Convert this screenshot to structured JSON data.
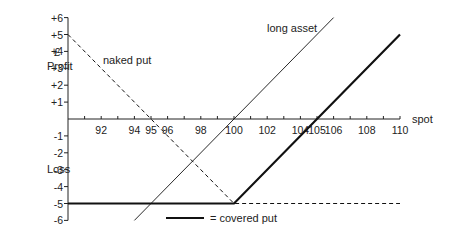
{
  "chart_data": {
    "type": "line",
    "title": "",
    "xlabel": "spot",
    "ylabel_top": "£\nProfit",
    "ylabel_bottom": "Loss",
    "xlim": [
      90,
      110
    ],
    "ylim": [
      -6,
      6
    ],
    "x_ticks": [
      92,
      94,
      95,
      96,
      98,
      100,
      102,
      104,
      105,
      106,
      108,
      110
    ],
    "y_ticks": [
      "+6",
      "+5",
      "+4",
      "+3",
      "+2",
      "+1",
      "-1",
      "-2",
      "-3",
      "-4",
      "-5",
      "-6"
    ],
    "grid": false,
    "series": [
      {
        "name": "naked put",
        "style": "dashed",
        "x": [
          90,
          100,
          110
        ],
        "y": [
          5,
          -5,
          -5
        ]
      },
      {
        "name": "long asset",
        "style": "thin-solid",
        "x": [
          94,
          106
        ],
        "y": [
          -6,
          6
        ]
      },
      {
        "name": "covered put",
        "style": "thick-solid",
        "x": [
          90,
          100,
          110
        ],
        "y": [
          -5,
          -5,
          5
        ]
      }
    ],
    "annotations": [
      "naked put",
      "long asset"
    ],
    "legend": {
      "entry": "= covered put",
      "position": "bottom-center"
    }
  },
  "labels": {
    "pound": "£",
    "profit": "Profit",
    "loss": "Loss",
    "spot": "spot",
    "naked_put": "naked put",
    "long_asset": "long asset",
    "legend_covered_put": "= covered put"
  }
}
